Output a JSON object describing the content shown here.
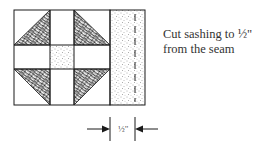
{
  "diagram": {
    "caption": {
      "line1": "Cut sashing to ½\"",
      "line2": "from the seam"
    },
    "dimension": {
      "label": "½\""
    },
    "colors": {
      "line": "#1a1a1a",
      "background": "#ffffff",
      "stipple": "#555555"
    }
  }
}
